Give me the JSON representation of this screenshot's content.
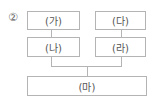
{
  "question": {
    "option_number": "②"
  },
  "diagram": {
    "boxes": {
      "ga": "(가)",
      "da": "(다)",
      "na": "(나)",
      "ra": "(라)",
      "ma": "(마)"
    },
    "line_color": "#b4b4b4",
    "text_color": "#555555"
  }
}
